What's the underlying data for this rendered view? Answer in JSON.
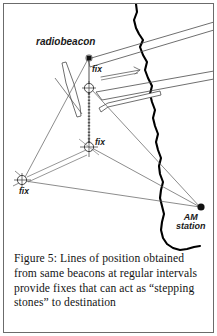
{
  "figure": {
    "caption": "Figure 5: Lines of position obtained from same beacons at regular intervals provide fixes that can act as “stepping stones” to destination",
    "caption_lines": [
      "Figure 5: Lines of position",
      "obtained from same beacons at",
      "regular intervals provide fixes",
      "that can act as “stepping",
      "stones” to destination"
    ]
  },
  "diagram": {
    "type": "navigation-chart",
    "labels": {
      "radiobeacon": "radiobeacon",
      "fix_top": "fix",
      "fix_middle": "fix",
      "fix_left": "fix",
      "am_station_line1": "AM",
      "am_station_line2": "station"
    },
    "colors": {
      "ink": "#1a1a1a",
      "line": "#5a5a5a",
      "coastline": "#000000",
      "paper": "#ffffff",
      "border": "#6b6b6b"
    },
    "stations": [
      {
        "name": "radiobeacon",
        "marker": "filled-square",
        "x": 89,
        "y": 58
      },
      {
        "name": "AM station",
        "marker": "filled-circle",
        "x": 201,
        "y": 207
      }
    ],
    "fixes": [
      {
        "name": "fix-top",
        "marker": "circle-with-cross",
        "x": 89,
        "y": 88
      },
      {
        "name": "fix-middle",
        "marker": "circle-with-cross",
        "x": 89,
        "y": 147
      },
      {
        "name": "fix-left",
        "marker": "circle-with-cross",
        "x": 22,
        "y": 180
      }
    ],
    "features": [
      "coastline",
      "pier-upper",
      "pier-lower",
      "jetty",
      "island-outline",
      "arrow-marker",
      "lines-of-position",
      "stepping-stone-track"
    ]
  }
}
